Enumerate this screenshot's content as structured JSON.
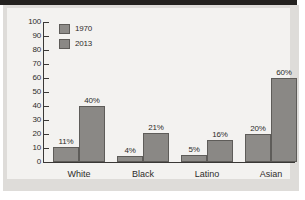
{
  "chart_data": {
    "type": "bar",
    "title": "",
    "xlabel": "",
    "ylabel": "",
    "ylim": [
      0,
      100
    ],
    "ytick_labels": [
      "100",
      "90",
      "80",
      "70",
      "60",
      "50",
      "40",
      "30",
      "20",
      "10",
      "0"
    ],
    "yticks": [
      100,
      90,
      80,
      70,
      60,
      50,
      40,
      30,
      20,
      10,
      0
    ],
    "grid": false,
    "legend_position": "top-left",
    "categories": [
      "White",
      "Black",
      "Latino",
      "Asian"
    ],
    "series": [
      {
        "name": "1970",
        "color": "#8d8b88",
        "values": [
          11,
          4,
          5,
          20
        ],
        "data_labels": [
          "11%",
          "4%",
          "5%",
          "20%"
        ]
      },
      {
        "name": "2013",
        "color": "#8a8885",
        "values": [
          40,
          21,
          16,
          60
        ],
        "data_labels": [
          "40%",
          "21%",
          "16%",
          "60%"
        ]
      }
    ]
  }
}
